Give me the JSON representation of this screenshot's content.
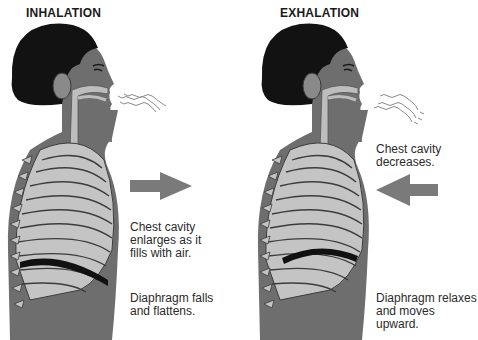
{
  "panels": [
    {
      "id": "inhalation",
      "title": "INHALATION",
      "captions": {
        "chest": [
          "Chest cavity",
          "enlarges as it",
          "fills with air."
        ],
        "diaphragm": [
          "Diaphragm falls",
          "and flattens."
        ]
      },
      "arrow_direction": "right",
      "air_direction": "in"
    },
    {
      "id": "exhalation",
      "title": "EXHALATION",
      "captions": {
        "chest": [
          "Chest cavity",
          "decreases."
        ],
        "diaphragm": [
          "Diaphragm relaxes",
          "and moves upward."
        ]
      },
      "arrow_direction": "left",
      "air_direction": "out"
    }
  ],
  "colors": {
    "skin": "#6e6e6e",
    "hair": "#121212",
    "ribs": "#c4c4c4",
    "rib_outline": "#3c3c3c",
    "airway": "#bdbdbd",
    "diaphragm": "#111111",
    "arrow": "#7a7a7a",
    "air_lines": "#8a8a8a"
  }
}
